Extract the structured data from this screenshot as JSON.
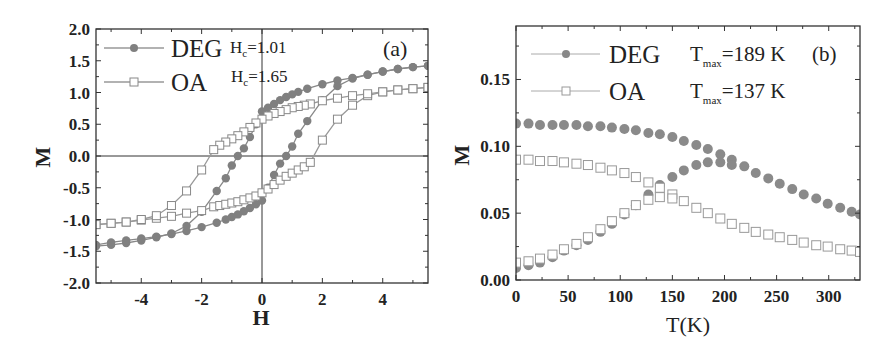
{
  "colors": {
    "deg": "#808080",
    "oa_line": "#9a9a9a",
    "oa_fill": "#ffffff",
    "axis": "#333333"
  },
  "chart_data": [
    {
      "type": "line",
      "panel_label": "(a)",
      "title": "",
      "xlabel": "H",
      "ylabel": "M",
      "xlim": [
        -5.5,
        5.5
      ],
      "ylim": [
        -2.0,
        2.0
      ],
      "xticks": [
        "-4",
        "-2",
        "0",
        "2",
        "4"
      ],
      "yticks": [
        "2.0",
        "1.5",
        "1.0",
        "0.5",
        "0.0",
        "-0.5",
        "-1.0",
        "-1.5",
        "-2.0"
      ],
      "grid": false,
      "zero_lines": true,
      "legend_position": "upper-left",
      "annotations": [
        {
          "text": "H",
          "sub": "c",
          "value": "=1.01"
        },
        {
          "text": "H",
          "sub": "c",
          "value": "=1.65"
        }
      ],
      "series": [
        {
          "name": "DEG",
          "marker": "filled-circle",
          "branches": [
            {
              "H": [
                -5.5,
                -5.0,
                -4.5,
                -4.0,
                -3.5,
                -3.0,
                -2.5,
                -2.0,
                -1.5,
                -1.2,
                -1.0,
                -0.8,
                -0.6,
                -0.4,
                -0.2,
                0.0,
                0.2,
                0.4,
                0.6,
                0.8,
                1.0,
                1.2,
                1.5,
                2.0,
                2.5,
                3.0,
                3.5,
                4.0,
                4.5,
                5.0,
                5.5
              ],
              "M": [
                -1.4,
                -1.36,
                -1.33,
                -1.3,
                -1.27,
                -1.23,
                -1.18,
                -1.12,
                -1.05,
                -1.0,
                -0.96,
                -0.92,
                -0.87,
                -0.82,
                -0.76,
                -0.7,
                -0.5,
                -0.3,
                -0.12,
                0.0,
                0.15,
                0.35,
                0.55,
                0.88,
                1.1,
                1.22,
                1.28,
                1.33,
                1.37,
                1.4,
                1.42
              ]
            },
            {
              "H": [
                5.5,
                5.0,
                4.5,
                4.0,
                3.5,
                3.0,
                2.5,
                2.0,
                1.5,
                1.2,
                1.0,
                0.8,
                0.6,
                0.4,
                0.2,
                0.0,
                -0.2,
                -0.4,
                -0.6,
                -0.8,
                -1.0,
                -1.2,
                -1.5,
                -2.0,
                -2.5,
                -3.0,
                -3.5,
                -4.0,
                -4.5,
                -5.0,
                -5.5
              ],
              "M": [
                1.42,
                1.4,
                1.37,
                1.33,
                1.28,
                1.23,
                1.19,
                1.13,
                1.06,
                1.01,
                0.97,
                0.93,
                0.88,
                0.82,
                0.76,
                0.7,
                0.5,
                0.3,
                0.12,
                0.0,
                -0.15,
                -0.35,
                -0.55,
                -0.88,
                -1.1,
                -1.22,
                -1.28,
                -1.33,
                -1.37,
                -1.4,
                -1.42
              ]
            }
          ]
        },
        {
          "name": "OA",
          "marker": "open-square",
          "branches": [
            {
              "H": [
                -5.5,
                -5.0,
                -4.5,
                -4.0,
                -3.5,
                -3.0,
                -2.5,
                -2.0,
                -1.6,
                -1.4,
                -1.2,
                -1.0,
                -0.8,
                -0.6,
                -0.4,
                -0.2,
                0.0,
                0.2,
                0.4,
                0.6,
                0.8,
                1.0,
                1.2,
                1.4,
                1.6,
                2.0,
                2.5,
                3.0,
                3.5,
                4.0,
                4.5,
                5.0,
                5.5
              ],
              "M": [
                -1.08,
                -1.06,
                -1.04,
                -1.01,
                -0.98,
                -0.95,
                -0.9,
                -0.86,
                -0.8,
                -0.78,
                -0.76,
                -0.74,
                -0.72,
                -0.69,
                -0.66,
                -0.63,
                -0.58,
                -0.52,
                -0.45,
                -0.38,
                -0.32,
                -0.27,
                -0.22,
                -0.17,
                -0.1,
                0.25,
                0.58,
                0.8,
                0.95,
                1.01,
                1.04,
                1.06,
                1.08
              ]
            },
            {
              "H": [
                5.5,
                5.0,
                4.5,
                4.0,
                3.5,
                3.0,
                2.5,
                2.0,
                1.6,
                1.4,
                1.2,
                1.0,
                0.8,
                0.6,
                0.4,
                0.2,
                0.0,
                -0.2,
                -0.4,
                -0.6,
                -0.8,
                -1.0,
                -1.2,
                -1.4,
                -1.6,
                -2.0,
                -2.5,
                -3.0,
                -3.5,
                -4.0,
                -4.5,
                -5.0,
                -5.5
              ],
              "M": [
                1.08,
                1.06,
                1.04,
                1.01,
                0.98,
                0.95,
                0.91,
                0.87,
                0.82,
                0.8,
                0.78,
                0.76,
                0.73,
                0.7,
                0.67,
                0.63,
                0.58,
                0.52,
                0.45,
                0.38,
                0.32,
                0.27,
                0.22,
                0.17,
                0.1,
                -0.22,
                -0.55,
                -0.78,
                -0.94,
                -1.0,
                -1.04,
                -1.06,
                -1.08
              ]
            }
          ]
        }
      ]
    },
    {
      "type": "scatter",
      "panel_label": "(b)",
      "title": "",
      "xlabel": "T(K)",
      "ylabel": "M",
      "xlim": [
        0,
        330
      ],
      "ylim": [
        0.0,
        0.19
      ],
      "xticks": [
        "0",
        "50",
        "100",
        "150",
        "200",
        "250",
        "300"
      ],
      "yticks": [
        "0.15",
        "0.10",
        "0.05",
        "0.00"
      ],
      "grid": false,
      "legend_position": "upper-left",
      "annotations": [
        {
          "text": "T",
          "sub": "max",
          "value": "=189 K"
        },
        {
          "text": "T",
          "sub": "max",
          "value": "=137 K"
        }
      ],
      "series": [
        {
          "name": "DEG FC",
          "marker": "filled-circle",
          "x": [
            0,
            12,
            23,
            35,
            46,
            58,
            69,
            81,
            92,
            104,
            115,
            127,
            138,
            150,
            161,
            173,
            184,
            196,
            207,
            219,
            230,
            242,
            253,
            265,
            276,
            288,
            299,
            311,
            322,
            330
          ],
          "y": [
            0.117,
            0.117,
            0.116,
            0.116,
            0.116,
            0.116,
            0.115,
            0.115,
            0.114,
            0.113,
            0.112,
            0.11,
            0.109,
            0.107,
            0.104,
            0.101,
            0.098,
            0.094,
            0.09,
            0.085,
            0.08,
            0.076,
            0.072,
            0.068,
            0.064,
            0.061,
            0.057,
            0.054,
            0.051,
            0.049
          ]
        },
        {
          "name": "DEG ZFC",
          "marker": "filled-circle",
          "x": [
            0,
            12,
            23,
            35,
            46,
            58,
            69,
            81,
            92,
            104,
            115,
            127,
            138,
            150,
            161,
            173,
            184,
            196,
            207
          ],
          "y": [
            0.009,
            0.011,
            0.013,
            0.017,
            0.022,
            0.026,
            0.03,
            0.036,
            0.042,
            0.049,
            0.056,
            0.064,
            0.071,
            0.077,
            0.082,
            0.086,
            0.088,
            0.088,
            0.086
          ]
        },
        {
          "name": "OA FC",
          "marker": "open-square",
          "x": [
            0,
            12,
            23,
            35,
            46,
            58,
            69,
            81,
            92,
            104,
            115,
            127,
            138,
            150,
            161,
            173,
            184,
            196,
            207,
            219,
            230,
            242,
            253,
            265,
            276,
            288,
            299,
            311,
            322,
            330
          ],
          "y": [
            0.09,
            0.09,
            0.089,
            0.089,
            0.088,
            0.087,
            0.086,
            0.084,
            0.082,
            0.08,
            0.077,
            0.073,
            0.069,
            0.064,
            0.059,
            0.054,
            0.05,
            0.046,
            0.042,
            0.039,
            0.036,
            0.034,
            0.032,
            0.03,
            0.028,
            0.026,
            0.025,
            0.023,
            0.022,
            0.021
          ]
        },
        {
          "name": "OA ZFC",
          "marker": "open-square",
          "x": [
            0,
            12,
            23,
            35,
            46,
            58,
            69,
            81,
            92,
            104,
            115,
            127,
            138,
            150
          ],
          "y": [
            0.013,
            0.014,
            0.016,
            0.019,
            0.023,
            0.027,
            0.032,
            0.038,
            0.044,
            0.05,
            0.056,
            0.06,
            0.062,
            0.061
          ]
        }
      ]
    }
  ],
  "panel_a": {
    "label": "(a)",
    "xlabel": "H",
    "ylabel": "M",
    "legend": [
      {
        "name": "DEG",
        "hc_main": "H",
        "hc_sub": "c",
        "hc_value": "=1.01"
      },
      {
        "name": "OA",
        "hc_main": "H",
        "hc_sub": "c",
        "hc_value": "=1.65"
      }
    ],
    "xticks": [
      {
        "v": -4,
        "label": "-4"
      },
      {
        "v": -2,
        "label": "-2"
      },
      {
        "v": 0,
        "label": "0"
      },
      {
        "v": 2,
        "label": "2"
      },
      {
        "v": 4,
        "label": "4"
      }
    ],
    "yticks": [
      {
        "v": 2.0,
        "label": "2.0"
      },
      {
        "v": 1.5,
        "label": "1.5"
      },
      {
        "v": 1.0,
        "label": "1.0"
      },
      {
        "v": 0.5,
        "label": "0.5"
      },
      {
        "v": 0.0,
        "label": "0.0"
      },
      {
        "v": -0.5,
        "label": "-0.5"
      },
      {
        "v": -1.0,
        "label": "-1.0"
      },
      {
        "v": -1.5,
        "label": "-1.5"
      },
      {
        "v": -2.0,
        "label": "-2.0"
      }
    ]
  },
  "panel_b": {
    "label": "(b)",
    "xlabel": "T(K)",
    "ylabel": "M",
    "legend": [
      {
        "name": "DEG",
        "t_main": "T",
        "t_sub": "max",
        "t_value": "=189 K"
      },
      {
        "name": "OA",
        "t_main": "T",
        "t_sub": "max",
        "t_value": "=137 K"
      }
    ],
    "xticks": [
      {
        "v": 0,
        "label": "0"
      },
      {
        "v": 50,
        "label": "50"
      },
      {
        "v": 100,
        "label": "100"
      },
      {
        "v": 150,
        "label": "150"
      },
      {
        "v": 200,
        "label": "200"
      },
      {
        "v": 250,
        "label": "250"
      },
      {
        "v": 300,
        "label": "300"
      }
    ],
    "yticks": [
      {
        "v": 0.15,
        "label": "0.15"
      },
      {
        "v": 0.1,
        "label": "0.10"
      },
      {
        "v": 0.05,
        "label": "0.05"
      },
      {
        "v": 0.0,
        "label": "0.00"
      }
    ]
  }
}
